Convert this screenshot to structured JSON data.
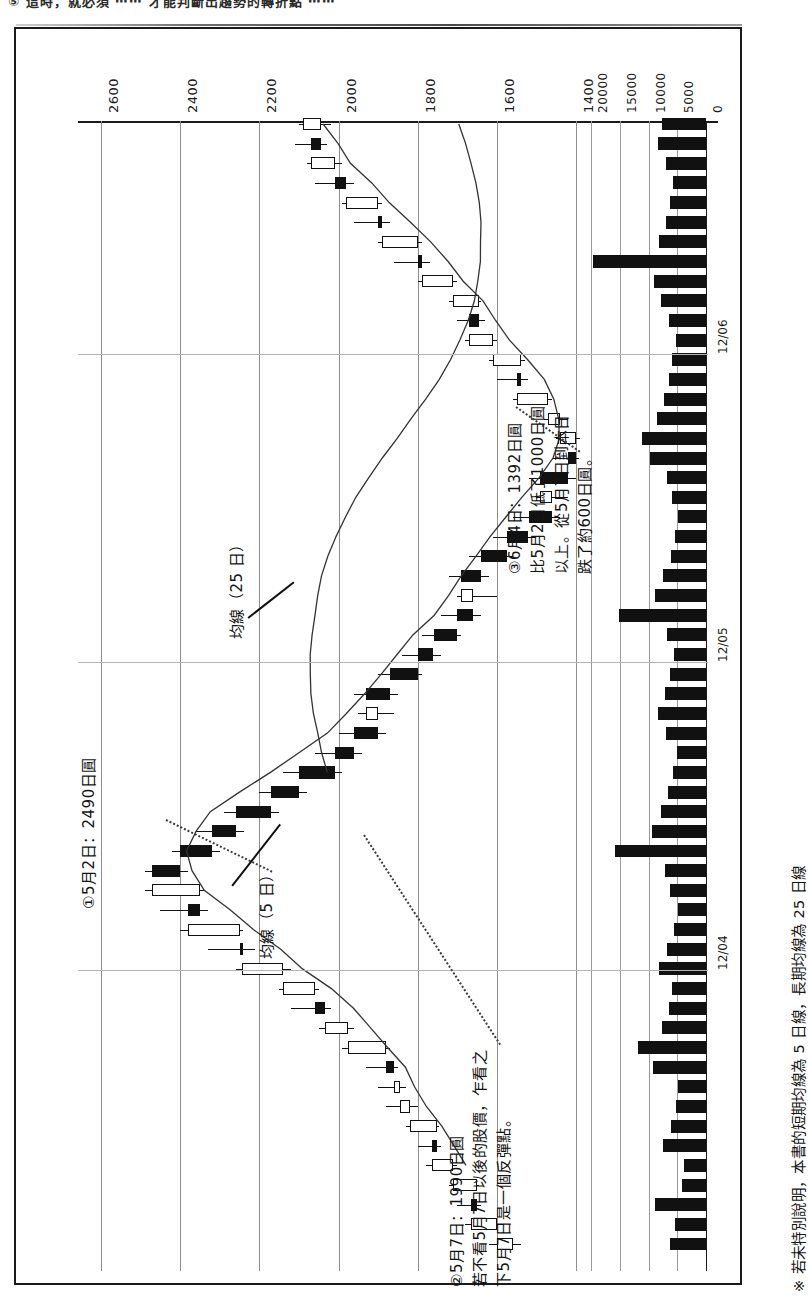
{
  "page": {
    "top_fragment": "⑤ 這時，就必須 ⋯⋯ 才能判斷出趨勢的轉折點 ⋯⋯",
    "footnote": "※ 若未特別說明，本書的短期均線為 5 日線，長期均線為 25 日線"
  },
  "chart_data": {
    "type": "candlestick",
    "title": "",
    "orientation": "rotated-90",
    "price_axis": {
      "label": "",
      "ticks": [
        2600,
        2400,
        2200,
        2000,
        1800,
        1600,
        1400
      ],
      "tick_labels": [
        "2600",
        "2400",
        "2200",
        "2000",
        "1800",
        "1600",
        "1400"
      ],
      "min": 1300,
      "max": 2700
    },
    "volume_axis": {
      "ticks": [
        20000,
        15000,
        10000,
        5000,
        0
      ],
      "tick_labels": [
        "20000",
        "15000",
        "10000",
        "5000",
        "0"
      ],
      "min": 0,
      "max": 22000
    },
    "date_axis": {
      "tick_labels": [
        "12/04",
        "12/05",
        "12/06"
      ],
      "tick_positions": [
        0.245,
        0.52,
        0.795
      ]
    },
    "series": [
      {
        "name": "均線（5 日）",
        "type": "line",
        "label": "均線（5 日）"
      },
      {
        "name": "均線（25 日）",
        "type": "line",
        "label": "均線（25 日）"
      }
    ],
    "legend": [
      "均線（5 日）",
      "均線（25 日）"
    ],
    "ohlc": [
      {
        "o": 1560,
        "h": 1620,
        "l": 1540,
        "c": 1600,
        "dir": "up"
      },
      {
        "o": 1600,
        "h": 1680,
        "l": 1585,
        "c": 1665,
        "dir": "up"
      },
      {
        "o": 1665,
        "h": 1700,
        "l": 1640,
        "c": 1650,
        "dir": "down"
      },
      {
        "o": 1650,
        "h": 1720,
        "l": 1645,
        "c": 1710,
        "dir": "up"
      },
      {
        "o": 1710,
        "h": 1780,
        "l": 1700,
        "c": 1765,
        "dir": "up"
      },
      {
        "o": 1765,
        "h": 1800,
        "l": 1740,
        "c": 1750,
        "dir": "down"
      },
      {
        "o": 1750,
        "h": 1830,
        "l": 1745,
        "c": 1820,
        "dir": "up"
      },
      {
        "o": 1820,
        "h": 1880,
        "l": 1800,
        "c": 1845,
        "dir": "up"
      },
      {
        "o": 1845,
        "h": 1900,
        "l": 1830,
        "c": 1860,
        "dir": "up"
      },
      {
        "o": 1860,
        "h": 1930,
        "l": 1850,
        "c": 1880,
        "dir": "down"
      },
      {
        "o": 1880,
        "h": 1990,
        "l": 1870,
        "c": 1975,
        "dir": "up"
      },
      {
        "o": 1975,
        "h": 2050,
        "l": 1960,
        "c": 2035,
        "dir": "up"
      },
      {
        "o": 2035,
        "h": 2120,
        "l": 2020,
        "c": 2060,
        "dir": "down"
      },
      {
        "o": 2060,
        "h": 2150,
        "l": 2050,
        "c": 2140,
        "dir": "up"
      },
      {
        "o": 2140,
        "h": 2260,
        "l": 2120,
        "c": 2245,
        "dir": "up"
      },
      {
        "o": 2245,
        "h": 2330,
        "l": 2210,
        "c": 2250,
        "dir": "down"
      },
      {
        "o": 2250,
        "h": 2400,
        "l": 2240,
        "c": 2380,
        "dir": "up"
      },
      {
        "o": 2380,
        "h": 2450,
        "l": 2330,
        "c": 2350,
        "dir": "down"
      },
      {
        "o": 2350,
        "h": 2490,
        "l": 2340,
        "c": 2470,
        "dir": "up"
      },
      {
        "o": 2470,
        "h": 2490,
        "l": 2380,
        "c": 2400,
        "dir": "down"
      },
      {
        "o": 2400,
        "h": 2420,
        "l": 2300,
        "c": 2320,
        "dir": "down"
      },
      {
        "o": 2320,
        "h": 2360,
        "l": 2240,
        "c": 2260,
        "dir": "down"
      },
      {
        "o": 2260,
        "h": 2290,
        "l": 2150,
        "c": 2170,
        "dir": "down"
      },
      {
        "o": 2170,
        "h": 2200,
        "l": 2080,
        "c": 2100,
        "dir": "down"
      },
      {
        "o": 2100,
        "h": 2140,
        "l": 1990,
        "c": 2010,
        "dir": "down"
      },
      {
        "o": 2010,
        "h": 2060,
        "l": 1940,
        "c": 1960,
        "dir": "down"
      },
      {
        "o": 1960,
        "h": 2000,
        "l": 1880,
        "c": 1900,
        "dir": "down"
      },
      {
        "o": 1900,
        "h": 1950,
        "l": 1860,
        "c": 1930,
        "dir": "up"
      },
      {
        "o": 1930,
        "h": 1960,
        "l": 1850,
        "c": 1870,
        "dir": "down"
      },
      {
        "o": 1870,
        "h": 1900,
        "l": 1790,
        "c": 1800,
        "dir": "down"
      },
      {
        "o": 1800,
        "h": 1840,
        "l": 1740,
        "c": 1760,
        "dir": "down"
      },
      {
        "o": 1760,
        "h": 1790,
        "l": 1690,
        "c": 1700,
        "dir": "down"
      },
      {
        "o": 1700,
        "h": 1740,
        "l": 1640,
        "c": 1660,
        "dir": "down"
      },
      {
        "o": 1660,
        "h": 1700,
        "l": 1600,
        "c": 1690,
        "dir": "up"
      },
      {
        "o": 1690,
        "h": 1720,
        "l": 1620,
        "c": 1640,
        "dir": "down"
      },
      {
        "o": 1640,
        "h": 1670,
        "l": 1560,
        "c": 1575,
        "dir": "down"
      },
      {
        "o": 1575,
        "h": 1610,
        "l": 1500,
        "c": 1520,
        "dir": "down"
      },
      {
        "o": 1520,
        "h": 1560,
        "l": 1440,
        "c": 1460,
        "dir": "down"
      },
      {
        "o": 1460,
        "h": 1500,
        "l": 1420,
        "c": 1490,
        "dir": "up"
      },
      {
        "o": 1490,
        "h": 1520,
        "l": 1400,
        "c": 1420,
        "dir": "down"
      },
      {
        "o": 1420,
        "h": 1460,
        "l": 1392,
        "c": 1400,
        "dir": "down"
      },
      {
        "o": 1400,
        "h": 1450,
        "l": 1390,
        "c": 1440,
        "dir": "up"
      },
      {
        "o": 1440,
        "h": 1480,
        "l": 1420,
        "c": 1470,
        "dir": "up"
      },
      {
        "o": 1470,
        "h": 1560,
        "l": 1460,
        "c": 1550,
        "dir": "up"
      },
      {
        "o": 1550,
        "h": 1600,
        "l": 1520,
        "c": 1540,
        "dir": "down"
      },
      {
        "o": 1540,
        "h": 1620,
        "l": 1530,
        "c": 1610,
        "dir": "up"
      },
      {
        "o": 1610,
        "h": 1680,
        "l": 1600,
        "c": 1670,
        "dir": "up"
      },
      {
        "o": 1670,
        "h": 1700,
        "l": 1630,
        "c": 1645,
        "dir": "down"
      },
      {
        "o": 1645,
        "h": 1720,
        "l": 1640,
        "c": 1710,
        "dir": "up"
      },
      {
        "o": 1710,
        "h": 1800,
        "l": 1700,
        "c": 1790,
        "dir": "up"
      },
      {
        "o": 1790,
        "h": 1860,
        "l": 1770,
        "c": 1800,
        "dir": "down"
      },
      {
        "o": 1800,
        "h": 1900,
        "l": 1790,
        "c": 1890,
        "dir": "up"
      },
      {
        "o": 1890,
        "h": 1960,
        "l": 1870,
        "c": 1900,
        "dir": "down"
      },
      {
        "o": 1900,
        "h": 1990,
        "l": 1890,
        "c": 1980,
        "dir": "up"
      },
      {
        "o": 1980,
        "h": 2060,
        "l": 1960,
        "c": 2010,
        "dir": "down"
      },
      {
        "o": 2010,
        "h": 2080,
        "l": 1990,
        "c": 2070,
        "dir": "up"
      },
      {
        "o": 2070,
        "h": 2110,
        "l": 2030,
        "c": 2045,
        "dir": "down"
      },
      {
        "o": 2045,
        "h": 2100,
        "l": 2020,
        "c": 2090,
        "dir": "up"
      }
    ],
    "volumes": [
      6200,
      5400,
      8800,
      4200,
      3900,
      7400,
      6100,
      5200,
      4800,
      9200,
      11800,
      7600,
      6400,
      5900,
      8100,
      6800,
      5500,
      4900,
      6300,
      7200,
      15800,
      9400,
      7800,
      6600,
      5800,
      5100,
      6900,
      8400,
      7100,
      6200,
      5600,
      6800,
      15200,
      8900,
      7400,
      6100,
      5400,
      4800,
      5900,
      6700,
      9800,
      11200,
      8600,
      7300,
      6500,
      5900,
      5200,
      6400,
      7800,
      9100,
      19600,
      8200,
      7000,
      6300,
      5700,
      6900,
      8300,
      7600
    ],
    "annotations": [
      {
        "id": "anno-1",
        "marker": "①",
        "lines": [
          "①5月2日：2490日圓"
        ]
      },
      {
        "id": "anno-2",
        "marker": "②",
        "lines": [
          "②5月7日：1990日圓",
          "若不看5月7日以後的股價，乍看之",
          "下5月7日是一個反彈點。"
        ]
      },
      {
        "id": "anno-3",
        "marker": "③",
        "lines": [
          "③6月4日：1392日圓",
          "比5月2日低了1000日圓",
          "以上。從5月7日到本日",
          "跌了約600日圓。"
        ]
      }
    ],
    "ma_labels": [
      {
        "id": "ma25",
        "text": "均線（25 日）"
      },
      {
        "id": "ma5",
        "text": "均線（5 日）"
      }
    ],
    "colors": {
      "ink": "#111111",
      "grid": "#8e8e8e",
      "background": "#ffffff"
    }
  }
}
